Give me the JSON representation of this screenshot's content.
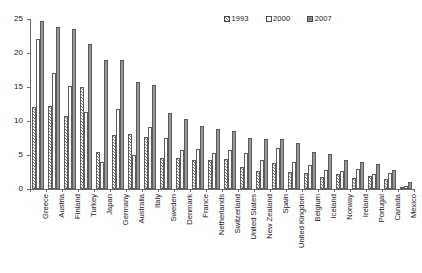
{
  "chart_data": {
    "type": "bar",
    "title": "",
    "xlabel": "",
    "ylabel": "",
    "ylim": [
      0,
      25
    ],
    "yticks": [
      0,
      5,
      10,
      15,
      20,
      25
    ],
    "grid": false,
    "legend_position": "top-right",
    "categories": [
      "Greece",
      "Austria",
      "Finland",
      "Turkey",
      "Japan",
      "Germany",
      "Australia",
      "Italy",
      "Sweden",
      "Denmark",
      "France",
      "Netherlands",
      "Switzerland",
      "United States",
      "New Zealand",
      "Spain",
      "United Kingdom",
      "Belgium",
      "Iceland",
      "Norway",
      "Ireland",
      "Portugal",
      "Canada",
      "Mexico"
    ],
    "series": [
      {
        "name": "1993",
        "pattern": "hatched",
        "values": [
          12.0,
          12.2,
          10.7,
          15.0,
          5.5,
          7.9,
          8.1,
          7.6,
          4.5,
          4.5,
          4.2,
          4.2,
          4.4,
          3.3,
          2.6,
          3.8,
          2.5,
          2.4,
          1.7,
          2.2,
          1.6,
          1.9,
          1.5,
          0.3
        ]
      },
      {
        "name": "2000",
        "pattern": "open",
        "values": [
          22.0,
          17.0,
          15.2,
          11.3,
          3.9,
          11.7,
          5.0,
          9.1,
          7.5,
          5.7,
          5.9,
          5.3,
          5.7,
          5.3,
          4.2,
          6.1,
          4.0,
          3.5,
          2.8,
          2.6,
          2.9,
          2.2,
          2.3,
          0.4
        ]
      },
      {
        "name": "2007",
        "pattern": "filled",
        "values": [
          24.7,
          23.8,
          23.5,
          21.3,
          19.0,
          19.0,
          15.7,
          15.3,
          11.2,
          10.3,
          9.2,
          8.8,
          8.6,
          7.5,
          7.4,
          7.3,
          6.8,
          5.5,
          5.2,
          4.2,
          4.0,
          3.7,
          2.8,
          1.0
        ]
      }
    ],
    "colors": {
      "series_1993": "#ffffff",
      "series_2000": "#ffffff",
      "series_2007": "#969696",
      "outline": "#5d5d5d",
      "axis": "#6b6b6b"
    }
  },
  "legend": {
    "items": [
      {
        "label": "1993"
      },
      {
        "label": "2000"
      },
      {
        "label": "2007"
      }
    ]
  }
}
